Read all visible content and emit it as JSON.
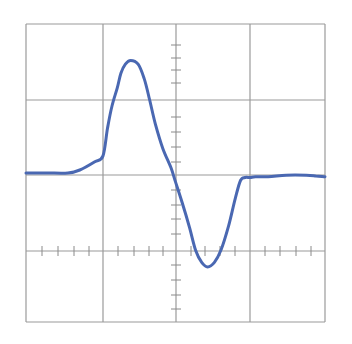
{
  "colors": {
    "background": "#ffffff",
    "grid": "#9a9a9a",
    "ticks": "#8a8a8a",
    "trace": "#4a68b2"
  },
  "plot_area": {
    "left": 26,
    "top": 24,
    "right": 325,
    "bottom": 322,
    "v_lines": [
      26,
      103,
      176,
      250,
      325
    ],
    "h_lines": [
      24,
      100,
      175,
      251,
      322
    ],
    "axis_x_y": 251,
    "axis_y_x": 176,
    "x_ticks": [
      42,
      58,
      74,
      89,
      118,
      134,
      149,
      163,
      191,
      205,
      220,
      235,
      265,
      280,
      296,
      311
    ],
    "y_ticks": [
      45,
      58,
      70,
      83,
      117,
      132,
      147,
      162,
      190,
      205,
      219,
      234,
      265,
      280,
      295,
      309
    ],
    "tick_half_length": 5
  },
  "chart_data": {
    "type": "line",
    "title": "",
    "xlabel": "",
    "ylabel": "",
    "grid": true,
    "grid_divisions": {
      "x": 4,
      "y": 4
    },
    "minor_ticks_per_division": 5,
    "legend": null,
    "xlim": [
      0,
      4
    ],
    "ylim": [
      -2,
      2
    ],
    "series": [
      {
        "name": "trace",
        "x": [
          0.0,
          0.28,
          0.56,
          0.72,
          0.92,
          1.03,
          1.09,
          1.15,
          1.22,
          1.27,
          1.33,
          1.4,
          1.5,
          1.58,
          1.65,
          1.73,
          1.83,
          1.94,
          2.0,
          2.09,
          2.19,
          2.27,
          2.35,
          2.43,
          2.52,
          2.61,
          2.71,
          2.8,
          2.87,
          2.93,
          3.0,
          3.07,
          3.24,
          3.48,
          3.75,
          3.88,
          4.0
        ],
        "y": [
          0.0,
          0.0,
          0.0,
          0.04,
          0.15,
          0.23,
          0.6,
          0.9,
          1.14,
          1.34,
          1.46,
          1.51,
          1.46,
          1.27,
          1.0,
          0.66,
          0.33,
          0.07,
          -0.12,
          -0.4,
          -0.74,
          -1.04,
          -1.2,
          -1.26,
          -1.2,
          -1.03,
          -0.71,
          -0.34,
          -0.1,
          -0.06,
          -0.06,
          -0.05,
          -0.05,
          -0.03,
          -0.03,
          -0.04,
          -0.05
        ]
      }
    ]
  }
}
